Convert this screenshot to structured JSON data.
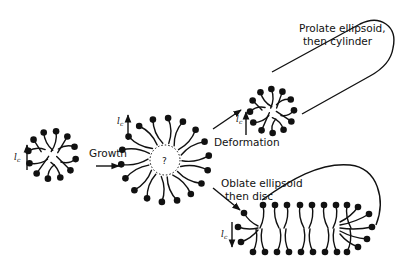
{
  "figure": {
    "labels": {
      "growth": "Growth",
      "deformation": "Deformation",
      "prolate_line1": "Prolate ellipsoid,",
      "prolate_line2": "then cylinder",
      "oblate_line1": "Oblate ellipsoid",
      "oblate_line2": "then disc",
      "chain_length_symbol": "l",
      "chain_length_subscript": "c",
      "core_unknown": "?"
    },
    "stages": [
      {
        "id": "small-spherical-micelle",
        "description": "small spherical micelle"
      },
      {
        "id": "grown-spherical-micelle",
        "description": "grown spherical micelle with uncertain core"
      },
      {
        "id": "prolate-micelle",
        "description": "prolate ellipsoid then cylinder"
      },
      {
        "id": "oblate-micelle",
        "description": "oblate ellipsoid then disc"
      }
    ],
    "transitions": [
      {
        "from": "small-spherical-micelle",
        "to": "grown-spherical-micelle",
        "label": "Growth"
      },
      {
        "from": "grown-spherical-micelle",
        "to": "prolate-micelle",
        "label": "Deformation"
      },
      {
        "from": "grown-spherical-micelle",
        "to": "oblate-micelle",
        "label": "Deformation"
      }
    ]
  }
}
